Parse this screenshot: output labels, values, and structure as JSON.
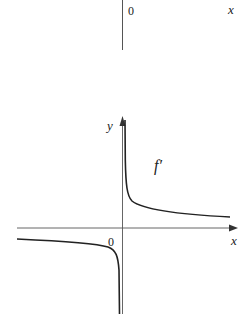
{
  "top_figure": {
    "origin_label": "0",
    "x_axis_label": "x"
  },
  "bottom_figure": {
    "y_axis_label": "y",
    "x_axis_label": "x",
    "origin_label": "0",
    "curve_label": "f′"
  },
  "colors": {
    "ink": "#222222",
    "background": "#ffffff"
  }
}
